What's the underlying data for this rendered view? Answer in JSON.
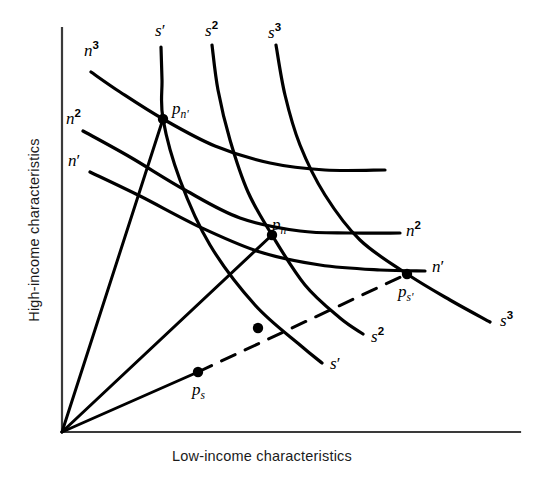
{
  "figure": {
    "axes": {
      "ylabel": "High-income characteristics",
      "xlabel": "Low-income characteristics",
      "origin": [
        62,
        432
      ],
      "y_top": 28,
      "x_right": 520
    }
  },
  "chart_data": {
    "type": "line",
    "title": "",
    "xlabel": "Low-income characteristics",
    "ylabel": "High-income characteristics",
    "grid": false,
    "legend": "none",
    "axis_ticks": "none",
    "series": [
      {
        "name": "n'",
        "label": "n'",
        "style": "solid",
        "points": [
          [
            90,
            172
          ],
          [
            140,
            196
          ],
          [
            200,
            227
          ],
          [
            260,
            252
          ],
          [
            320,
            265
          ],
          [
            380,
            270
          ],
          [
            425,
            271
          ]
        ]
      },
      {
        "name": "n2",
        "label": "n2",
        "style": "solid",
        "points": [
          [
            83,
            131
          ],
          [
            130,
            157
          ],
          [
            185,
            190
          ],
          [
            240,
            218
          ],
          [
            300,
            231
          ],
          [
            350,
            233
          ],
          [
            400,
            233
          ]
        ]
      },
      {
        "name": "n3",
        "label": "n3",
        "style": "solid",
        "points": [
          [
            91,
            72
          ],
          [
            120,
            92
          ],
          [
            163,
            119
          ],
          [
            215,
            146
          ],
          [
            270,
            163
          ],
          [
            325,
            170
          ],
          [
            385,
            170
          ]
        ]
      },
      {
        "name": "s'",
        "label": "s'",
        "style": "solid",
        "points": [
          [
            161,
            47
          ],
          [
            162,
            80
          ],
          [
            163,
            119
          ],
          [
            180,
            180
          ],
          [
            210,
            245
          ],
          [
            255,
            305
          ],
          [
            300,
            345
          ],
          [
            322,
            363
          ]
        ]
      },
      {
        "name": "s2",
        "label": "s2",
        "style": "solid",
        "points": [
          [
            212,
            45
          ],
          [
            218,
            90
          ],
          [
            230,
            140
          ],
          [
            248,
            192
          ],
          [
            272,
            235
          ],
          [
            305,
            285
          ],
          [
            340,
            318
          ],
          [
            363,
            334
          ]
        ]
      },
      {
        "name": "s3",
        "label": "s3",
        "style": "solid",
        "points": [
          [
            276,
            45
          ],
          [
            285,
            95
          ],
          [
            300,
            145
          ],
          [
            325,
            195
          ],
          [
            360,
            240
          ],
          [
            407,
            274
          ],
          [
            450,
            300
          ],
          [
            490,
            322
          ]
        ]
      },
      {
        "name": "ray-steep",
        "label": "",
        "style": "solid",
        "points": [
          [
            62,
            432
          ],
          [
            163,
            119
          ]
        ]
      },
      {
        "name": "ray-middle",
        "label": "",
        "style": "solid",
        "points": [
          [
            62,
            432
          ],
          [
            272,
            235
          ]
        ]
      },
      {
        "name": "ray-shallow",
        "label": "",
        "style": "solid",
        "points": [
          [
            62,
            432
          ],
          [
            198,
            372
          ]
        ]
      },
      {
        "name": "ray-shallow-dashed",
        "label": "",
        "style": "dashed",
        "points": [
          [
            198,
            372
          ],
          [
            407,
            274
          ]
        ]
      }
    ],
    "points": [
      {
        "name": "p_n'",
        "label": "p",
        "sub": "n'",
        "x": 163,
        "y": 119,
        "label_x": 172,
        "label_y": 100
      },
      {
        "name": "p_n",
        "label": "p",
        "sub": "n",
        "x": 272,
        "y": 235,
        "label_x": 272,
        "label_y": 216
      },
      {
        "name": "p_s'",
        "label": "p",
        "sub": "s'",
        "x": 407,
        "y": 274,
        "label_x": 398,
        "label_y": 283
      },
      {
        "name": "p_s",
        "label": "p",
        "sub": "s",
        "x": 198,
        "y": 372,
        "label_x": 192,
        "label_y": 381
      },
      {
        "name": "node-mid-dashed",
        "label": "",
        "sub": "",
        "x": 258,
        "y": 328,
        "label_x": 0,
        "label_y": 0
      }
    ]
  },
  "labels": {
    "n1": {
      "base": "n",
      "sup": "′",
      "x": 68,
      "y": 152
    },
    "n2": {
      "base": "n",
      "sup": "2",
      "x": 66,
      "y": 108
    },
    "n3": {
      "base": "n",
      "sup": "3",
      "x": 84,
      "y": 40
    },
    "n2_right": {
      "base": "n",
      "sup": "2",
      "x": 406,
      "y": 220
    },
    "n1_right": {
      "base": "n",
      "sup": "′",
      "x": 432,
      "y": 258
    },
    "s1_top": {
      "base": "s",
      "sup": "′",
      "x": 155,
      "y": 22
    },
    "s2_top": {
      "base": "s",
      "sup": "2",
      "x": 205,
      "y": 20
    },
    "s3_top": {
      "base": "s",
      "sup": "3",
      "x": 268,
      "y": 22
    },
    "s1_end": {
      "base": "s",
      "sup": "′",
      "x": 330,
      "y": 355
    },
    "s2_end": {
      "base": "s",
      "sup": "2",
      "x": 371,
      "y": 326
    },
    "s3_end": {
      "base": "s",
      "sup": "3",
      "x": 500,
      "y": 310
    }
  },
  "colors": {
    "ink": "#000000",
    "axis": "#3a3a3a",
    "background": "#ffffff"
  }
}
